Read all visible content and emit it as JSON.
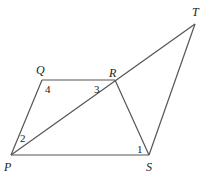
{
  "diagram": {
    "type": "geometry-figure",
    "points": {
      "P": {
        "label": "P",
        "x": 11,
        "y": 155,
        "lx": 4,
        "ly": 171
      },
      "Q": {
        "label": "Q",
        "x": 42,
        "y": 80,
        "lx": 36,
        "ly": 74
      },
      "R": {
        "label": "R",
        "x": 115,
        "y": 80,
        "lx": 109,
        "ly": 77
      },
      "S": {
        "label": "S",
        "x": 149,
        "y": 155,
        "lx": 146,
        "ly": 171
      },
      "T": {
        "label": "T",
        "x": 195,
        "y": 24,
        "lx": 192,
        "ly": 16
      }
    },
    "segments": [
      [
        "P",
        "Q"
      ],
      [
        "Q",
        "R"
      ],
      [
        "R",
        "S"
      ],
      [
        "P",
        "S"
      ],
      [
        "P",
        "T"
      ],
      [
        "S",
        "T"
      ]
    ],
    "angles": [
      {
        "label": "1",
        "x": 137,
        "y": 153
      },
      {
        "label": "2",
        "x": 20,
        "y": 142
      },
      {
        "label": "3",
        "x": 94,
        "y": 93
      },
      {
        "label": "4",
        "x": 45,
        "y": 93
      }
    ]
  }
}
